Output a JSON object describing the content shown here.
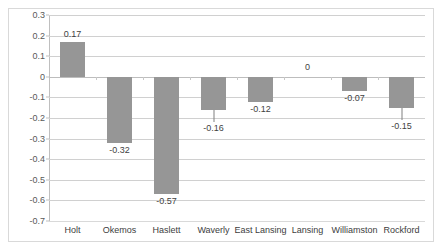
{
  "chart_data": {
    "type": "bar",
    "title": "",
    "subtitle": "",
    "xlabel": "",
    "ylabel": "",
    "categories": [
      "Holt",
      "Okemos",
      "Haslett",
      "Waverly",
      "East Lansing",
      "Lansing",
      "Williamston",
      "Rockford"
    ],
    "values": [
      0.17,
      -0.32,
      -0.57,
      -0.16,
      -0.12,
      0,
      -0.07,
      -0.15
    ],
    "data_labels": [
      "0.17",
      "-0.32",
      "-0.57",
      "-0.16",
      "-0.12",
      "0",
      "-0.07",
      "-0.15"
    ],
    "ylim": [
      -0.7,
      0.3
    ],
    "ytick_labels": [
      "0.3",
      "0.2",
      "0.1",
      "0",
      "-0.1",
      "-0.2",
      "-0.3",
      "-0.4",
      "-0.5",
      "-0.6",
      "-0.7"
    ],
    "ytick_values": [
      0.3,
      0.2,
      0.1,
      0,
      -0.1,
      -0.2,
      -0.3,
      -0.4,
      -0.5,
      -0.6,
      -0.7
    ],
    "ytick_step": 0.1,
    "grid": true,
    "grid_axis": "y",
    "legend": false,
    "legend_position": "none",
    "bar_color": "#969696",
    "gridline_color": "#d0d0d0",
    "zero_line_color": "#bdbdbd",
    "axis_text_color": "#595959",
    "label_text_color": "#3f3f3f",
    "frame_color": "#d9d9d9",
    "background_color": "#ffffff",
    "label_leader_lines": [
      "Waverly",
      "Rockford"
    ]
  }
}
